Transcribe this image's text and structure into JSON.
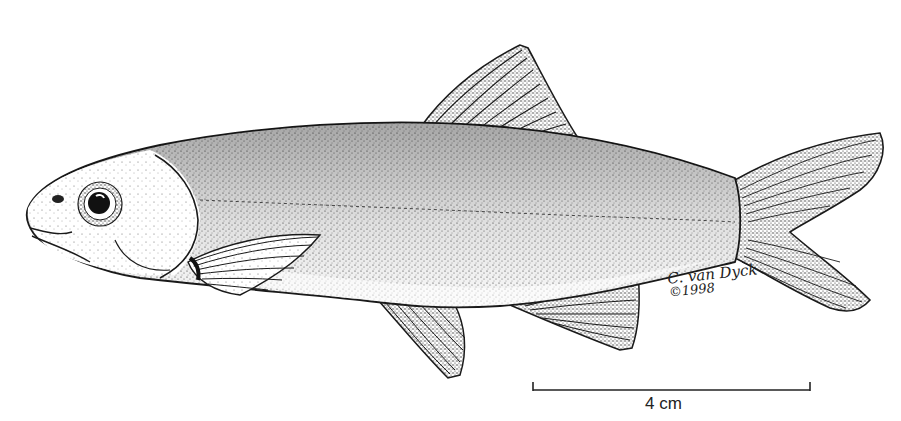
{
  "illustration": {
    "subject": "fish",
    "style": "black-and-white stipple line drawing",
    "ink_color": "#1a1a1a",
    "background_color": "#ffffff"
  },
  "signature": {
    "name": "C. van Dyck",
    "copyright": "©1998"
  },
  "scale_bar": {
    "label": "4 cm"
  }
}
